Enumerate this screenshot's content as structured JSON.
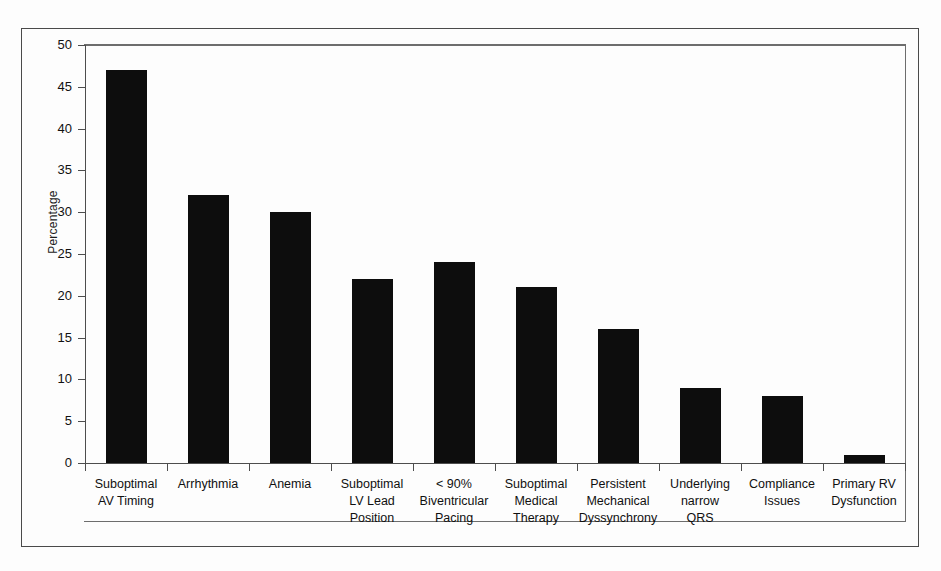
{
  "chart_data": {
    "type": "bar",
    "title": "",
    "xlabel": "",
    "ylabel": "Percentage",
    "ylim": [
      0,
      50
    ],
    "yticks": [
      0,
      5,
      10,
      15,
      20,
      25,
      30,
      35,
      40,
      45,
      50
    ],
    "grid": false,
    "legend": null,
    "bar_color": "#0d0d0d",
    "categories": [
      "Suboptimal AV Timing",
      "Arrhythmia",
      "Anemia",
      "Suboptimal LV Lead Position",
      "< 90% Biventricular Pacing",
      "Suboptimal Medical Therapy",
      "Persistent Mechanical Dyssynchrony",
      "Underlying narrow QRS",
      "Compliance Issues",
      "Primary RV Dysfunction"
    ],
    "category_lines": [
      [
        "Suboptimal",
        "AV Timing"
      ],
      [
        "Arrhythmia"
      ],
      [
        "Anemia"
      ],
      [
        "Suboptimal",
        "LV Lead",
        "Position"
      ],
      [
        "< 90%",
        "Biventricular",
        "Pacing"
      ],
      [
        "Suboptimal",
        "Medical",
        "Therapy"
      ],
      [
        "Persistent",
        "Mechanical",
        "Dyssynchrony"
      ],
      [
        "Underlying",
        "narrow",
        "QRS"
      ],
      [
        "Compliance",
        "Issues"
      ],
      [
        "Primary RV",
        "Dysfunction"
      ]
    ],
    "values": [
      47,
      32,
      30,
      22,
      24,
      21,
      16,
      9,
      8,
      1
    ]
  }
}
